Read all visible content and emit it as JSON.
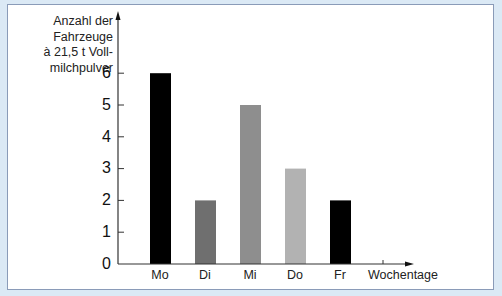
{
  "chart_data": {
    "type": "bar",
    "title": "",
    "xlabel": "Wochentage",
    "ylabel": "Anzahl der Fahrzeuge à 21,5 t Vollmilchpulver",
    "ylabel_lines": [
      "Anzahl der",
      "Fahrzeuge",
      "à 21,5 t Voll-",
      "milchpulver"
    ],
    "categories": [
      "Mo",
      "Di",
      "Mi",
      "Do",
      "Fr"
    ],
    "values": [
      6,
      2,
      5,
      3,
      2
    ],
    "bar_colors": [
      "#000000",
      "#6f6f6f",
      "#8e8e8e",
      "#b2b2b2",
      "#000000"
    ],
    "yticks": [
      "0",
      "1",
      "2",
      "3",
      "4",
      "5",
      "6"
    ],
    "ylim": [
      0,
      6
    ],
    "grid": false,
    "legend": null
  },
  "colors": {
    "background": "#dbe9f5",
    "panel": "#ffffff",
    "panel_border": "#8a9bb8",
    "axis": "#333333"
  }
}
